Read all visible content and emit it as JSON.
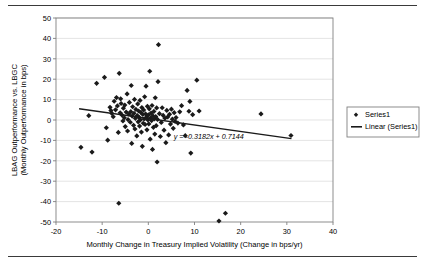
{
  "figure": {
    "has_top_rule": true,
    "has_bottom_rule": true,
    "rule_color": "#3a3a3a",
    "background": "#ffffff"
  },
  "chart_data": {
    "type": "scatter",
    "title": "",
    "xlabel": "Monthly Change in Treasury Implied Volatility (Change in bps/yr)",
    "ylabel": "LBAG Outperformance vs. LBGC (Monthly Outperformance in bps)",
    "ylabel_line1": "LBAG Outperformance vs. LBGC",
    "ylabel_line2": "(Monthly Outperformance in bps)",
    "xlim": [
      -20,
      40
    ],
    "ylim": [
      -50,
      50
    ],
    "xticks": [
      -20,
      -10,
      0,
      10,
      20,
      30,
      40
    ],
    "yticks": [
      -50,
      -40,
      -30,
      -20,
      -10,
      0,
      10,
      20,
      30,
      40,
      50
    ],
    "xtick_labels": [
      "-20",
      "-10",
      "0",
      "10",
      "20",
      "30",
      "40"
    ],
    "ytick_labels": [
      "-50",
      "-40",
      "-30",
      "-20",
      "-10",
      "0",
      "10",
      "20",
      "30",
      "40",
      "50"
    ],
    "grid": {
      "horizontal": true,
      "vertical": false,
      "color": "#d9d9d9"
    },
    "marker": {
      "shape": "diamond",
      "color": "#1a1a1a",
      "size": 2.6
    },
    "plot_border_color": "#808080",
    "legend": {
      "position": "right",
      "border_color": "#808080",
      "entries": [
        {
          "label": "Series1",
          "type": "marker",
          "color": "#1a1a1a"
        },
        {
          "label": "Linear (Series1)",
          "type": "line",
          "color": "#1a1a1a"
        }
      ]
    },
    "trendline": {
      "equation_text": "y = -0.3182x + 0.7144",
      "slope": -0.3182,
      "intercept": 0.7144,
      "x_start": -15.0,
      "x_end": 31.0,
      "color": "#1a1a1a",
      "width": 1.4
    },
    "series": [
      {
        "name": "Series1",
        "points": [
          [
            -14.6,
            -13.4
          ],
          [
            -12.9,
            2.1
          ],
          [
            -12.2,
            -15.7
          ],
          [
            -11.2,
            18.0
          ],
          [
            -9.5,
            20.9
          ],
          [
            -9.1,
            -3.8
          ],
          [
            -8.8,
            -9.9
          ],
          [
            -8.3,
            6.2
          ],
          [
            -8.1,
            4.6
          ],
          [
            -7.9,
            3.2
          ],
          [
            -7.6,
            1.6
          ],
          [
            -7.4,
            9.2
          ],
          [
            -7.1,
            5.0
          ],
          [
            -6.9,
            11.0
          ],
          [
            -6.7,
            6.9
          ],
          [
            -6.5,
            -6.1
          ],
          [
            -6.4,
            -40.8
          ],
          [
            -6.3,
            22.9
          ],
          [
            -6.1,
            3.5
          ],
          [
            -6.0,
            10.4
          ],
          [
            -5.9,
            8.1
          ],
          [
            -5.7,
            2.4
          ],
          [
            -5.5,
            -0.5
          ],
          [
            -5.4,
            5.8
          ],
          [
            -5.2,
            1.1
          ],
          [
            -5.1,
            7.3
          ],
          [
            -5.0,
            -3.2
          ],
          [
            -4.8,
            3.9
          ],
          [
            -4.6,
            12.8
          ],
          [
            -4.5,
            -5.4
          ],
          [
            -4.4,
            0.2
          ],
          [
            -4.2,
            2.9
          ],
          [
            -4.1,
            8.6
          ],
          [
            -3.9,
            -1.1
          ],
          [
            -3.8,
            4.1
          ],
          [
            -3.7,
            16.9
          ],
          [
            -3.6,
            -11.5
          ],
          [
            -3.5,
            1.9
          ],
          [
            -3.4,
            6.5
          ],
          [
            -3.2,
            -2.6
          ],
          [
            -3.1,
            3.3
          ],
          [
            -3.0,
            10.1
          ],
          [
            -2.9,
            -4.4
          ],
          [
            -2.8,
            0.8
          ],
          [
            -2.7,
            5.2
          ],
          [
            -2.5,
            -7.8
          ],
          [
            -2.4,
            2.2
          ],
          [
            -2.3,
            7.9
          ],
          [
            -2.2,
            -0.9
          ],
          [
            -2.1,
            4.4
          ],
          [
            -2.0,
            1.3
          ],
          [
            -1.9,
            -3.0
          ],
          [
            -1.8,
            9.6
          ],
          [
            -1.7,
            0.1
          ],
          [
            -1.6,
            3.7
          ],
          [
            -1.5,
            -5.9
          ],
          [
            -1.4,
            6.1
          ],
          [
            -1.3,
            -12.9
          ],
          [
            -1.2,
            2.7
          ],
          [
            -1.1,
            -1.6
          ],
          [
            -1.0,
            4.9
          ],
          [
            -0.9,
            0.5
          ],
          [
            -0.8,
            11.4
          ],
          [
            -0.7,
            -2.2
          ],
          [
            -0.6,
            3.0
          ],
          [
            -0.5,
            16.6
          ],
          [
            -0.4,
            1.4
          ],
          [
            -0.3,
            -4.8
          ],
          [
            -0.2,
            6.7
          ],
          [
            -0.1,
            0.0
          ],
          [
            0.0,
            2.5
          ],
          [
            0.1,
            -1.9
          ],
          [
            0.2,
            5.5
          ],
          [
            0.3,
            23.9
          ],
          [
            0.4,
            -9.4
          ],
          [
            0.5,
            1.0
          ],
          [
            0.6,
            3.4
          ],
          [
            0.7,
            -0.3
          ],
          [
            0.8,
            7.1
          ],
          [
            0.9,
            -14.4
          ],
          [
            1.0,
            2.0
          ],
          [
            1.1,
            -3.6
          ],
          [
            1.2,
            4.2
          ],
          [
            1.3,
            0.6
          ],
          [
            1.4,
            -6.9
          ],
          [
            1.5,
            10.9
          ],
          [
            1.6,
            1.7
          ],
          [
            1.7,
            -2.8
          ],
          [
            1.8,
            5.9
          ],
          [
            1.9,
            -20.6
          ],
          [
            2.0,
            0.3
          ],
          [
            2.1,
            18.8
          ],
          [
            2.2,
            36.9
          ],
          [
            2.4,
            3.1
          ],
          [
            2.6,
            -8.1
          ],
          [
            2.8,
            -1.2
          ],
          [
            3.0,
            6.0
          ],
          [
            3.2,
            2.3
          ],
          [
            3.4,
            -5.0
          ],
          [
            3.6,
            0.9
          ],
          [
            3.8,
            -11.1
          ],
          [
            4.0,
            4.7
          ],
          [
            4.2,
            1.5
          ],
          [
            4.4,
            -7.3
          ],
          [
            4.6,
            2.8
          ],
          [
            4.8,
            -2.0
          ],
          [
            5.0,
            5.3
          ],
          [
            5.2,
            0.4
          ],
          [
            5.4,
            -4.1
          ],
          [
            5.6,
            3.6
          ],
          [
            5.8,
            -0.7
          ],
          [
            6.0,
            1.2
          ],
          [
            6.4,
            -1.5
          ],
          [
            6.8,
            4.0
          ],
          [
            7.2,
            7.0
          ],
          [
            7.6,
            -2.4
          ],
          [
            8.0,
            -7.7
          ],
          [
            8.4,
            14.5
          ],
          [
            8.8,
            4.3
          ],
          [
            9.0,
            9.1
          ],
          [
            9.2,
            -16.2
          ],
          [
            9.6,
            2.6
          ],
          [
            10.5,
            19.5
          ],
          [
            11.0,
            4.4
          ],
          [
            15.3,
            -49.5
          ],
          [
            16.7,
            -45.7
          ],
          [
            24.4,
            3.0
          ],
          [
            30.9,
            -7.6
          ]
        ]
      }
    ]
  }
}
